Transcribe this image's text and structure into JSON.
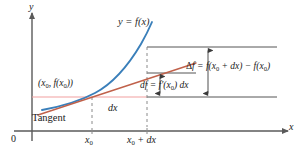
{
  "figure": {
    "background": "#ffffff",
    "colors": {
      "curve": "#3a7fba",
      "tangent": "#c0614a",
      "horizontal_rule": "#f2a0a0",
      "axis": "#5a5a5a",
      "construction": "#555555",
      "dashed": "#8a8a8a",
      "text": "#1a1a1a"
    }
  },
  "axes": {
    "x_axis_label": "x",
    "y_axis_label": "y",
    "origin_label": "0",
    "ticks": [
      {
        "id": "x0",
        "label_plain": "x0",
        "label_html": "x<sub>0</sub>"
      },
      {
        "id": "x0-plus-dx",
        "label_plain": "x0 + dx",
        "label_html": "x<sub>0</sub> + dx"
      }
    ]
  },
  "curve": {
    "label_plain": "y = f(x)",
    "label_html": "y = f(x)"
  },
  "tangent": {
    "label": "Tangent"
  },
  "point": {
    "label_plain": "(x0, f(x0))",
    "label_html": "(x<sub>0</sub>, f(x<sub>0</sub>))"
  },
  "annotations": {
    "dx_label_plain": "dx",
    "dx_label_html": "dx",
    "df_label_plain": "df = f'(x0) dx",
    "df_label_html": "df = f&prime;(x<sub>0</sub>) dx",
    "delta_f_label_plain": "Δf = f(x0 + dx) − f(x0)",
    "delta_f_label_html": "<span class=\"up\">Δ</span>f = f(x<sub>0</sub> + dx) − f(x<sub>0</sub>)"
  }
}
